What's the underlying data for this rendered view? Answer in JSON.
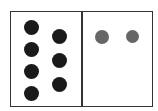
{
  "diagram": {
    "type": "two-panel dot comparison",
    "colors": {
      "frame": "#333333",
      "left_dots": "#1a1a1a",
      "right_dots": "#666666",
      "background": "#ffffff"
    },
    "left_panel": {
      "count": 7,
      "dots": [
        {
          "cx": 31,
          "cy": 27,
          "r": 7.5
        },
        {
          "cx": 31,
          "cy": 49,
          "r": 7.5
        },
        {
          "cx": 31,
          "cy": 71,
          "r": 7.5
        },
        {
          "cx": 31,
          "cy": 93,
          "r": 7.5
        },
        {
          "cx": 59,
          "cy": 36,
          "r": 7.5
        },
        {
          "cx": 59,
          "cy": 60,
          "r": 7.5
        },
        {
          "cx": 59,
          "cy": 84,
          "r": 7.5
        }
      ]
    },
    "right_panel": {
      "count": 2,
      "dots": [
        {
          "cx": 102,
          "cy": 37,
          "r": 7
        },
        {
          "cx": 132,
          "cy": 36,
          "r": 6.5
        }
      ]
    }
  }
}
